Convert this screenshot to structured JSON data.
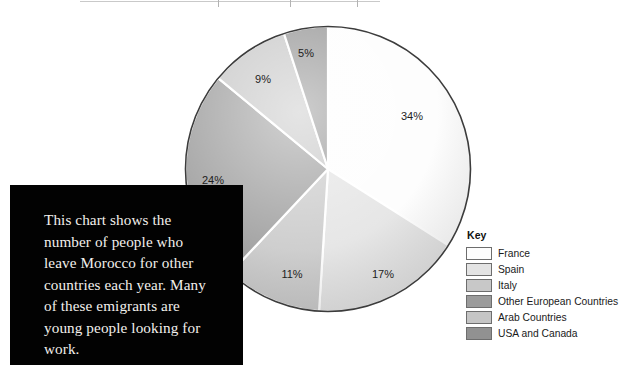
{
  "caption": {
    "text": "This chart shows the number of people who leave Morocco for other countries each year. Many of these emigrants are young people looking for work.",
    "background_color": "#020202",
    "text_color": "#f2f0ec"
  },
  "legend": {
    "title": "Key",
    "items": [
      {
        "label": "France",
        "color": "#fdfdfd"
      },
      {
        "label": "Spain",
        "color": "#e3e3e3"
      },
      {
        "label": "Italy",
        "color": "#c8c8c8"
      },
      {
        "label": "Other European Countries",
        "color": "#9b9b9b"
      },
      {
        "label": "Arab Countries",
        "color": "#c5c5c5"
      },
      {
        "label": "USA and Canada",
        "color": "#919191"
      }
    ]
  },
  "chart_data": {
    "type": "pie",
    "title": "",
    "subtitle": "",
    "xlabel": "",
    "ylabel": "",
    "legend_position": "right",
    "grid": false,
    "start_angle_deg": 0,
    "direction": "clockwise",
    "units": "percent",
    "categories": [
      "France",
      "Spain",
      "Italy",
      "Other European Countries",
      "Arab Countries",
      "USA and Canada"
    ],
    "values": [
      34,
      17,
      11,
      24,
      9,
      5
    ],
    "colors": [
      "#fdfdfd",
      "#e3e3e3",
      "#c8c8c8",
      "#9b9b9b",
      "#c5c5c5",
      "#919191"
    ],
    "slices": [
      {
        "label": "France",
        "value": 34,
        "data_label": "34%",
        "color": "#fdfdfd",
        "label_x": 228,
        "label_y": 95
      },
      {
        "label": "Spain",
        "value": 17,
        "data_label": "17%",
        "color": "#e3e3e3",
        "label_x": 199,
        "label_y": 253
      },
      {
        "label": "Italy",
        "value": 11,
        "data_label": "11%",
        "color": "#c8c8c8",
        "label_x": 108,
        "label_y": 253
      },
      {
        "label": "Other European Countries",
        "value": 24,
        "data_label": "24%",
        "color": "#9b9b9b",
        "label_x": 29,
        "label_y": 159
      },
      {
        "label": "Arab Countries",
        "value": 9,
        "data_label": "9%",
        "color": "#c5c5c5",
        "label_x": 79,
        "label_y": 58
      },
      {
        "label": "USA and Canada",
        "value": 5,
        "data_label": "5%",
        "color": "#919191",
        "label_x": 122,
        "label_y": 32
      }
    ],
    "separator_color": "#ffffff",
    "outline_color": "#3c3c3c"
  }
}
